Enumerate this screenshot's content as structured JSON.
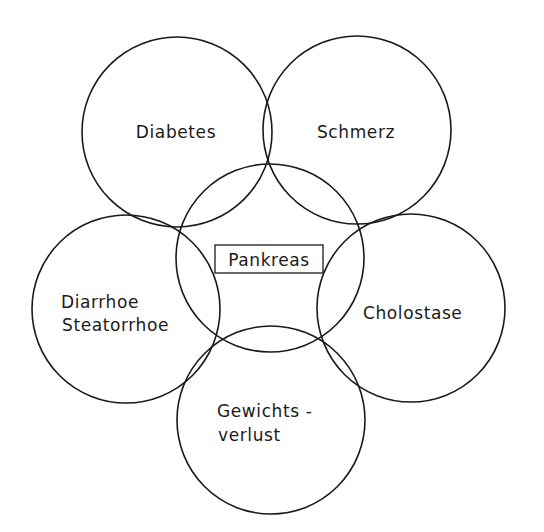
{
  "diagram": {
    "type": "overlapping-circles",
    "center": {
      "id": "pankreas",
      "label": "Pankreas",
      "boxed": true
    },
    "satellites": [
      {
        "id": "diabetes",
        "lines": [
          "Diabetes"
        ]
      },
      {
        "id": "schmerz",
        "lines": [
          "Schmerz"
        ]
      },
      {
        "id": "cholostase",
        "lines": [
          "Cholostase"
        ]
      },
      {
        "id": "gewichtsverlust",
        "lines": [
          "Gewichts -",
          "verlust"
        ]
      },
      {
        "id": "diarrhoe-steatorrhoe",
        "lines": [
          "Diarrhoe",
          "Steatorrhoe"
        ]
      }
    ],
    "edges": [
      {
        "from": "pankreas",
        "to": "diabetes",
        "relation": "overlap"
      },
      {
        "from": "pankreas",
        "to": "schmerz",
        "relation": "overlap"
      },
      {
        "from": "pankreas",
        "to": "cholostase",
        "relation": "overlap"
      },
      {
        "from": "pankreas",
        "to": "gewichtsverlust",
        "relation": "overlap"
      },
      {
        "from": "pankreas",
        "to": "diarrhoe-steatorrhoe",
        "relation": "overlap"
      },
      {
        "from": "diabetes",
        "to": "schmerz",
        "relation": "overlap"
      },
      {
        "from": "schmerz",
        "to": "cholostase",
        "relation": "overlap"
      },
      {
        "from": "cholostase",
        "to": "gewichtsverlust",
        "relation": "overlap"
      },
      {
        "from": "gewichtsverlust",
        "to": "diarrhoe-steatorrhoe",
        "relation": "overlap"
      },
      {
        "from": "diarrhoe-steatorrhoe",
        "to": "diabetes",
        "relation": "overlap"
      }
    ]
  }
}
